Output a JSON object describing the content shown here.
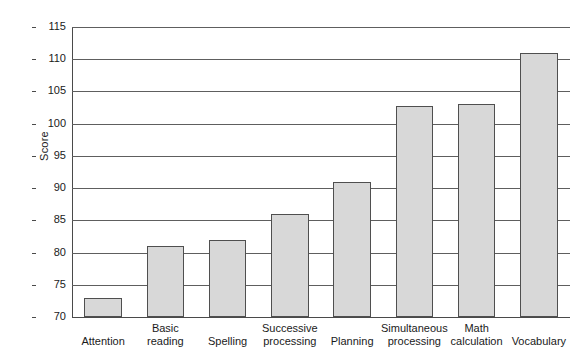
{
  "chart_data": {
    "type": "bar",
    "title": "",
    "xlabel": "",
    "ylabel": "Score",
    "ylim": [
      70,
      115
    ],
    "ytick_step": 5,
    "yticks": [
      70,
      75,
      80,
      85,
      90,
      95,
      100,
      105,
      110,
      115
    ],
    "ytick_labels": [
      "70",
      "75",
      "80",
      "85",
      "90",
      "95",
      "100",
      "105",
      "110",
      "115"
    ],
    "grid": true,
    "legend": false,
    "legend_position": "none",
    "categories": [
      "Attention",
      "Basic\nreading",
      "Spelling",
      "Successive\nprocessing",
      "Planning",
      "Simultaneous\nprocessing",
      "Math\ncalculation",
      "Vocabulary"
    ],
    "values": [
      73,
      81,
      82,
      86,
      91,
      102.7,
      103,
      111
    ],
    "bar_fill_color": "#d8d8d8",
    "bar_edge_color": "#4f4f4f",
    "grid_color": "#5e5e5e",
    "axis_color": "#4a4a4a",
    "background_color": "#ffffff"
  }
}
